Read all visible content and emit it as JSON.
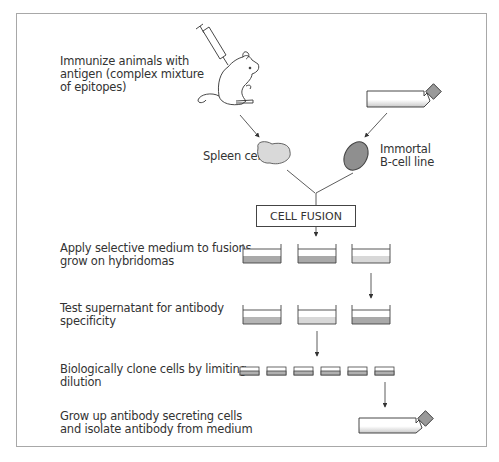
{
  "diagram": {
    "steps": [
      {
        "id": "immunize",
        "label": "Immunize animals with\nantigen (complex mixture\nof epitopes)"
      },
      {
        "id": "selective-medium",
        "label": "Apply selective medium to fusions,\ngrow on hybridomas"
      },
      {
        "id": "test-supernatant",
        "label": "Test supernatant for antibody\nspecificity"
      },
      {
        "id": "clone",
        "label": "Biologically clone cells by limiting\ndilution"
      },
      {
        "id": "grow-up",
        "label": "Grow up antibody secreting cells\nand isolate antibody from medium"
      }
    ],
    "nodes": {
      "spleen_cells": "Spleen cells",
      "immortal_line": "Immortal\nB-cell line",
      "cell_fusion": "CELL FUSION"
    },
    "icons": [
      "mouse-with-syringe-icon",
      "culture-flask-icon",
      "spleen-cell-icon",
      "b-cell-icon",
      "culture-dish-icon",
      "arrow-icon"
    ],
    "colors": {
      "frame": "#a8a8a8",
      "line": "#444444",
      "spleen_fill": "#d9d9d9",
      "bcell_fill": "#8f8f8f",
      "medium_dark": "#a9a9a9",
      "medium_light": "#d8d8d8",
      "flask_cap": "#9a9a9a"
    }
  }
}
